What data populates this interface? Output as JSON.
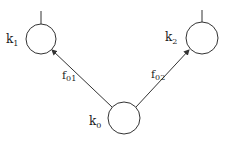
{
  "diagram": {
    "nodes": [
      {
        "id": "k0",
        "label": "k",
        "sub": "0",
        "cx": 124,
        "cy": 118,
        "r": 16
      },
      {
        "id": "k1",
        "label": "k",
        "sub": "1",
        "cx": 41,
        "cy": 39,
        "r": 15
      },
      {
        "id": "k2",
        "label": "k",
        "sub": "2",
        "cx": 202,
        "cy": 38,
        "r": 16
      }
    ],
    "edges": [
      {
        "id": "f01",
        "label": "f",
        "sub": "01",
        "from": "k0",
        "to": "k1"
      },
      {
        "id": "f02",
        "label": "f",
        "sub": "02",
        "from": "k0",
        "to": "k2"
      }
    ],
    "colors": {
      "stroke": "#333333",
      "text": "#222222"
    }
  }
}
